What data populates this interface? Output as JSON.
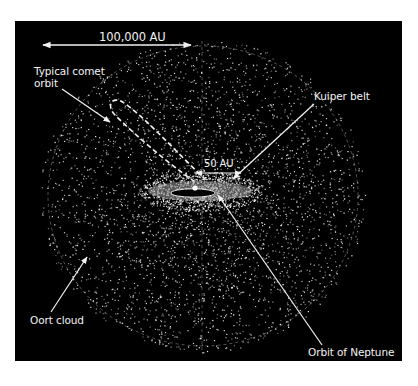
{
  "diagram": {
    "background_color": "#000000",
    "foreground_color": "#f2f2f2",
    "scale_bars": [
      {
        "id": "large-scale",
        "label": "100,000 AU"
      },
      {
        "id": "small-scale",
        "label": "50 AU"
      }
    ],
    "labels": {
      "comet_orbit": "Typical comet orbit",
      "kuiper_belt": "Kuiper belt",
      "oort_cloud": "Oort cloud",
      "neptune_orbit": "Orbit of Neptune"
    }
  }
}
